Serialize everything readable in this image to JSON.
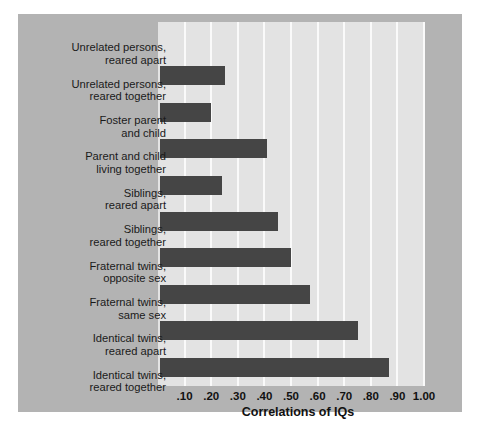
{
  "chart_data": {
    "type": "bar",
    "orientation": "horizontal",
    "title": "",
    "xlabel": "Correlations of IQs",
    "ylabel": "",
    "xlim": [
      0.0,
      1.0
    ],
    "xticks": [
      ".10",
      ".20",
      ".30",
      ".40",
      ".50",
      ".60",
      ".70",
      ".80",
      ".90",
      "1.00"
    ],
    "xtick_values": [
      0.1,
      0.2,
      0.3,
      0.4,
      0.5,
      0.6,
      0.7,
      0.8,
      0.9,
      1.0
    ],
    "grid": true,
    "legend": "none",
    "categories": [
      "Unrelated persons,\nreared apart",
      "Unrelated persons,\nreared together",
      "Foster parent\nand child",
      "Parent and child\nliving together",
      "Siblings,\nreared apart",
      "Siblings,\nreared together",
      "Fraternal twins,\nopposite sex",
      "Fraternal twins,\nsame sex",
      "Identical twins,\nreared apart",
      "Identical twins,\nreared together"
    ],
    "values": [
      0.0,
      0.25,
      0.2,
      0.41,
      0.24,
      0.45,
      0.5,
      0.57,
      0.75,
      0.87
    ],
    "bar_color": "#454545",
    "plot_background": "#e3e3e3",
    "panel_background": "#b3b3b3",
    "gridline_color": "#fafafa"
  },
  "categories": [
    {
      "line1": "Unrelated persons,",
      "line2": "reared apart"
    },
    {
      "line1": "Unrelated persons,",
      "line2": "reared together"
    },
    {
      "line1": "Foster parent",
      "line2": "and child"
    },
    {
      "line1": "Parent and child",
      "line2": "living together"
    },
    {
      "line1": "Siblings,",
      "line2": "reared apart"
    },
    {
      "line1": "Siblings,",
      "line2": "reared together"
    },
    {
      "line1": "Fraternal twins,",
      "line2": "opposite sex"
    },
    {
      "line1": "Fraternal twins,",
      "line2": "same sex"
    },
    {
      "line1": "Identical twins,",
      "line2": "reared apart"
    },
    {
      "line1": "Identical twins,",
      "line2": "reared together"
    }
  ],
  "axis": {
    "label": "Correlations of IQs",
    "ticks": [
      ".10",
      ".20",
      ".30",
      ".40",
      ".50",
      ".60",
      ".70",
      ".80",
      ".90",
      "1.00"
    ]
  }
}
